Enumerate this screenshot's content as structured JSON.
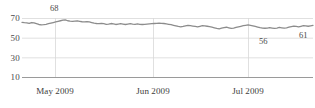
{
  "chart_data": {
    "type": "line",
    "title": "",
    "subtitle": "",
    "xlabel": "",
    "ylabel": "",
    "grid": true,
    "legend": false,
    "legend_position": "none",
    "line_color": "#8c8c8c",
    "grid_color": "#d8d8d8",
    "axis_color": "#9a9a9a",
    "background": "#ffffff",
    "ylim": [
      10,
      74
    ],
    "yticks": [
      10,
      30,
      50,
      70
    ],
    "ytick_labels": [
      "10",
      "30",
      "50",
      "70"
    ],
    "xticks": [
      "May 2009",
      "Jun 2009",
      "Jul 2009"
    ],
    "xtick_labels": [
      "May 2009",
      "Jun 2009",
      "Jul 2009"
    ],
    "xlim": [
      "2009-04-10",
      "2009-08-05"
    ],
    "annotations": [
      {
        "label": "68",
        "value": 68,
        "x_index": 18,
        "position": "above"
      },
      {
        "label": "56",
        "value": 56,
        "x_index": 86,
        "position": "below"
      },
      {
        "label": "61",
        "value": 61,
        "x_index": 107,
        "position": "below-right"
      }
    ],
    "series": [
      {
        "name": "value",
        "values": [
          65.5,
          65.2,
          65.0,
          64.6,
          65.4,
          65.0,
          64.2,
          63.4,
          63.0,
          63.2,
          63.6,
          64.2,
          64.8,
          65.4,
          66.0,
          66.6,
          67.2,
          67.8,
          68.0,
          67.2,
          66.8,
          66.6,
          66.8,
          67.0,
          66.6,
          66.2,
          66.0,
          66.2,
          66.0,
          65.4,
          64.8,
          64.4,
          64.2,
          64.6,
          64.2,
          63.6,
          63.8,
          64.4,
          64.0,
          63.4,
          63.8,
          64.2,
          63.8,
          63.4,
          63.8,
          64.2,
          63.8,
          63.6,
          64.0,
          63.6,
          63.4,
          63.6,
          63.8,
          64.0,
          64.2,
          64.4,
          64.6,
          64.8,
          64.6,
          64.4,
          64.0,
          63.6,
          63.2,
          62.6,
          62.0,
          61.4,
          61.0,
          61.4,
          62.0,
          62.6,
          62.2,
          61.8,
          61.4,
          61.0,
          61.6,
          62.2,
          62.0,
          61.6,
          61.2,
          60.6,
          60.0,
          59.4,
          59.0,
          59.6,
          60.2,
          60.6,
          60.0,
          59.4,
          59.8,
          60.4,
          61.0,
          61.6,
          62.2,
          62.6,
          63.0,
          62.6,
          62.0,
          61.4,
          60.8,
          60.2,
          59.8,
          59.6,
          59.8,
          60.2,
          59.8,
          59.4,
          59.8,
          60.4,
          60.0,
          59.6,
          60.0,
          60.6,
          61.2,
          61.8,
          61.4,
          61.0,
          61.6,
          62.2,
          62.0,
          61.6,
          62.0,
          62.4
        ]
      }
    ]
  }
}
